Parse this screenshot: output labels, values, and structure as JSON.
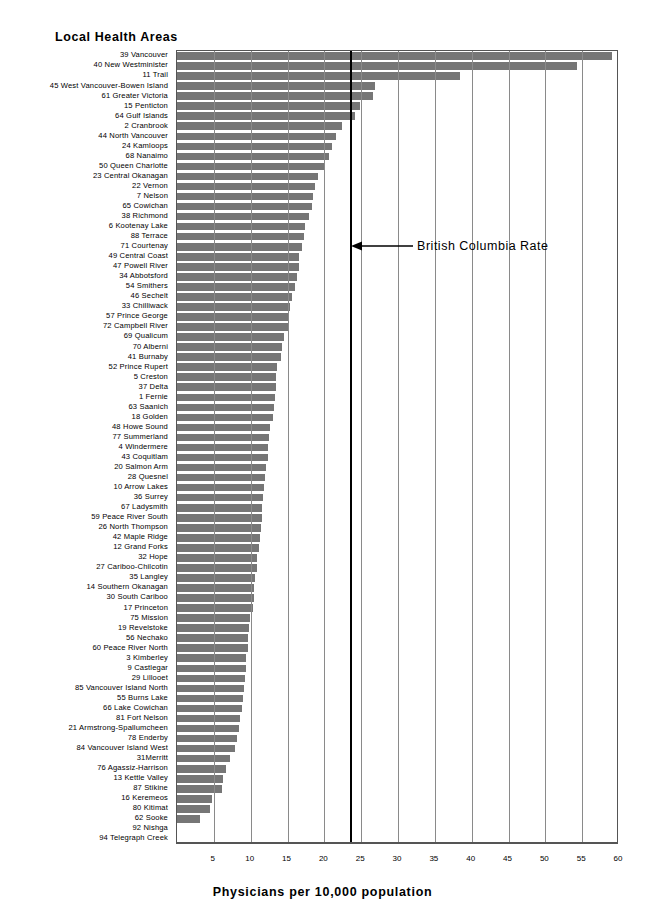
{
  "chart_data": {
    "type": "bar",
    "orientation": "horizontal",
    "title": "Local Health Areas",
    "xlabel": "Physicians per 10,000 population",
    "ylabel": "Local Health Areas",
    "xlim": [
      0,
      60
    ],
    "xticks": [
      5,
      10,
      15,
      20,
      25,
      30,
      35,
      40,
      45,
      50,
      55,
      60
    ],
    "grid": true,
    "legend": false,
    "bar_color": "#767676",
    "annotations": [
      {
        "text": "British Columbia Rate",
        "x_value": 23.5,
        "type": "reference-line-arrow"
      }
    ],
    "categories": [
      "39 Vancouver",
      "40 New Westminister",
      "11 Trail",
      "45 West Vancouver-Bowen Island",
      "61 Greater Victoria",
      "15  Penticton",
      "64 Gulf Islands",
      "2 Cranbrook",
      "44 North Vancouver",
      "24 Kamloops",
      "68 Nanaimo",
      "50 Queen Charlotte",
      "23 Central Okanagan",
      "22 Vernon",
      "7 Nelson",
      "65 Cowichan",
      "38 Richmond",
      "6 Kootenay Lake",
      "88 Terrace",
      "71 Courtenay",
      "49 Central Coast",
      "47 Powell River",
      "34 Abbotsford",
      "54 Smithers",
      "46 Sechelt",
      "33 Chilliwack",
      "57 Prince George",
      "72 Campbell River",
      "69 Qualicum",
      "70 Alberni",
      "41 Burnaby",
      "52 Prince Rupert",
      "5 Creston",
      "37 Delta",
      "1 Fernie",
      "63 Saanich",
      "18 Golden",
      "48 Howe Sound",
      "77 Summerland",
      "4 Windermere",
      "43 Coquitlam",
      "20 Salmon Arm",
      "28 Quesnel",
      "10 Arrow Lakes",
      "36 Surrey",
      "67 Ladysmith",
      "59 Peace River South",
      "26 North Thompson",
      "42 Maple Ridge",
      "12 Grand Forks",
      "32 Hope",
      "27 Cariboo-Chilcotin",
      "35 Langley",
      "14   Southern Okanagan",
      "30 South Cariboo",
      "17 Princeton",
      "75 Mission",
      "19 Revelstoke",
      "56 Nechako",
      "60 Peace River North",
      "3 Kimberley",
      "9 Castlegar",
      "29 Lillooet",
      "85 Vancouver Island North",
      "55 Burns Lake",
      "66 Lake Cowichan",
      "81 Fort Nelson",
      "21 Armstrong-Spallumcheen",
      "78 Enderby",
      "84 Vancouver Island West",
      "31Merritt",
      "76 Agassiz-Harrison",
      "13 Kettle Valley",
      "87 Stikine",
      "16 Keremeos",
      "80 Kitimat",
      "62 Sooke",
      "92 Nishga",
      "94 Telegraph Creek"
    ],
    "values": [
      59.0,
      54.3,
      38.4,
      26.9,
      26.6,
      24.9,
      24.2,
      22.4,
      21.6,
      21.0,
      20.6,
      19.9,
      19.2,
      18.7,
      18.5,
      18.3,
      17.9,
      17.4,
      17.2,
      17.0,
      16.6,
      16.5,
      16.3,
      16.0,
      15.6,
      15.4,
      15.2,
      15.1,
      14.5,
      14.2,
      14.1,
      13.6,
      13.5,
      13.4,
      13.3,
      13.1,
      13.0,
      12.6,
      12.5,
      12.4,
      12.3,
      12.1,
      12.0,
      11.8,
      11.7,
      11.6,
      11.5,
      11.4,
      11.3,
      11.1,
      10.9,
      10.8,
      10.6,
      10.5,
      10.4,
      10.3,
      9.9,
      9.8,
      9.7,
      9.6,
      9.4,
      9.3,
      9.2,
      9.1,
      8.9,
      8.8,
      8.5,
      8.4,
      8.1,
      7.9,
      7.2,
      6.6,
      6.2,
      6.1,
      4.8,
      4.5,
      3.1,
      0.0,
      0.0
    ]
  }
}
